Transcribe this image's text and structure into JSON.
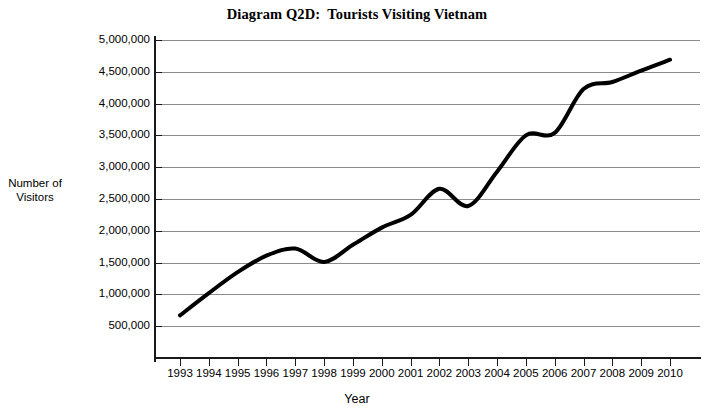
{
  "chart_data": {
    "type": "line",
    "title": "Diagram Q2D:  Tourists Visiting Vietnam",
    "xlabel": "Year",
    "ylabel": "Number of\nVisitors",
    "ylabel_line1": "Number of",
    "ylabel_line2": "Visitors",
    "categories": [
      "1993",
      "1994",
      "1995",
      "1996",
      "1997",
      "1998",
      "1999",
      "2000",
      "2001",
      "2002",
      "2003",
      "2004",
      "2005",
      "2006",
      "2007",
      "2008",
      "2009",
      "2010"
    ],
    "x": [
      1993,
      1994,
      1995,
      1996,
      1997,
      1998,
      1999,
      2000,
      2001,
      2002,
      2003,
      2004,
      2005,
      2006,
      2007,
      2008,
      2009,
      2010
    ],
    "values": [
      670000,
      1020000,
      1350000,
      1610000,
      1720000,
      1510000,
      1780000,
      2050000,
      2250000,
      2660000,
      2390000,
      2930000,
      3500000,
      3540000,
      4230000,
      4340000,
      4520000,
      4690000
    ],
    "series": [
      {
        "name": "Tourists Visiting Vietnam",
        "values": [
          670000,
          1020000,
          1350000,
          1610000,
          1720000,
          1510000,
          1780000,
          2050000,
          2250000,
          2660000,
          2390000,
          2930000,
          3500000,
          3540000,
          4230000,
          4340000,
          4520000,
          4690000
        ],
        "color": "#000000"
      }
    ],
    "ylim": [
      0,
      5000000
    ],
    "ytick_values": [
      5000000,
      4500000,
      4000000,
      3500000,
      3000000,
      2500000,
      2000000,
      1500000,
      1000000,
      500000,
      0
    ],
    "ytick_labels": [
      "5,000,000",
      "4,500,000",
      "4,000,000",
      "3,500,000",
      "3,000,000",
      "2,500,000",
      "2,000,000",
      "1,500,000",
      "1,000,000",
      "500,000",
      ""
    ],
    "grid": true,
    "grid_axis": "y",
    "grid_color": "#8c8c8c",
    "legend": "none",
    "axis_color": "#1a1a1a",
    "line_color": "#000000",
    "line_width": 4,
    "background": "#ffffff"
  }
}
